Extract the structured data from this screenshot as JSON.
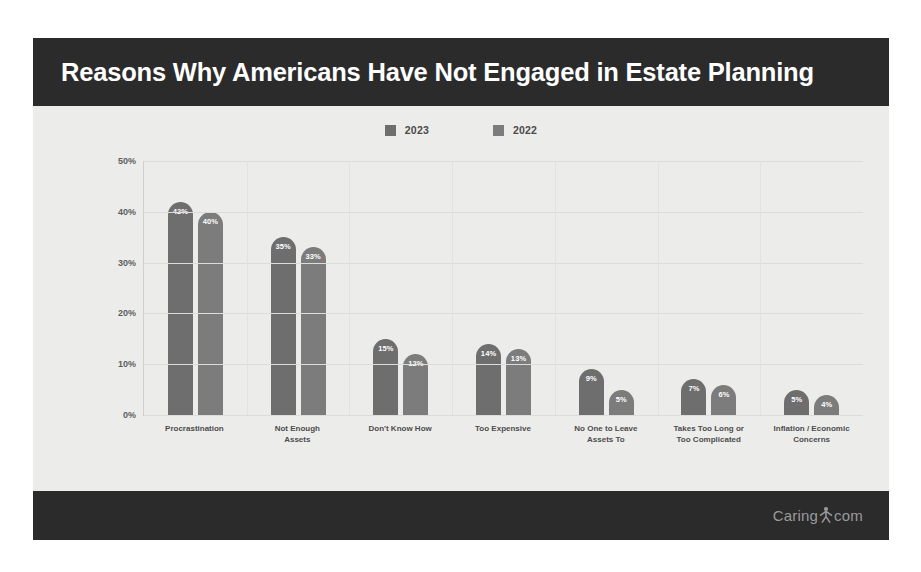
{
  "header": {
    "title": "Reasons Why Americans Have Not Engaged in Estate Planning",
    "background_color": "#2b2b2b",
    "text_color": "#ffffff"
  },
  "footer": {
    "brand_prefix": "Caring",
    "brand_suffix": "com",
    "brand_mark": "person-icon",
    "background_color": "#2b2b2b",
    "text_color": "#9a9a9a"
  },
  "chart_data": {
    "type": "bar",
    "title": "Reasons Why Americans Have Not Engaged in Estate Planning",
    "xlabel": "",
    "ylabel": "",
    "ylim": [
      0,
      50
    ],
    "ytick_labels": [
      "50%",
      "40%",
      "30%",
      "20%",
      "10%",
      "0%"
    ],
    "ytick_values": [
      50,
      40,
      30,
      20,
      10,
      0
    ],
    "grid": true,
    "legend_position": "top-center",
    "categories": [
      "Procrastination",
      "Not Enough Assets",
      "Don't Know How",
      "Too Expensive",
      "No One to Leave Assets To",
      "Takes Too Long or Too Complicated",
      "Inflation / Economic Concerns"
    ],
    "category_lines": [
      [
        "Procrastination"
      ],
      [
        "Not Enough",
        "Assets"
      ],
      [
        "Don't Know How"
      ],
      [
        "Too Expensive"
      ],
      [
        "No One to Leave",
        "Assets To"
      ],
      [
        "Takes Too Long or",
        "Too Complicated"
      ],
      [
        "Inflation / Economic",
        "Concerns"
      ]
    ],
    "series": [
      {
        "name": "2023",
        "color": "#6e6e6e",
        "values": [
          42,
          35,
          15,
          14,
          9,
          7,
          5
        ],
        "labels": [
          "42%",
          "35%",
          "15%",
          "14%",
          "9%",
          "7%",
          "5%"
        ]
      },
      {
        "name": "2022",
        "color": "#7c7c7c",
        "values": [
          40,
          33,
          12,
          13,
          5,
          6,
          4
        ],
        "labels": [
          "40%",
          "33%",
          "12%",
          "13%",
          "5%",
          "6%",
          "4%"
        ]
      }
    ]
  }
}
